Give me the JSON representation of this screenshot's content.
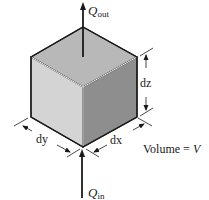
{
  "diagram": {
    "type": "control-volume-cube",
    "labels": {
      "q_out_main": "Q",
      "q_out_sub": "out",
      "q_in_main": "Q",
      "q_in_sub": "in",
      "dz": "dz",
      "dx": "dx",
      "dy": "dy",
      "volume_prefix": "Volume = ",
      "volume_var": "V"
    },
    "colors": {
      "top_face": "#b8b8b8",
      "left_face": "#d6d6d6",
      "right_face": "#8e8e8e",
      "edge": "#1a1a1a",
      "background": "#ffffff"
    }
  }
}
